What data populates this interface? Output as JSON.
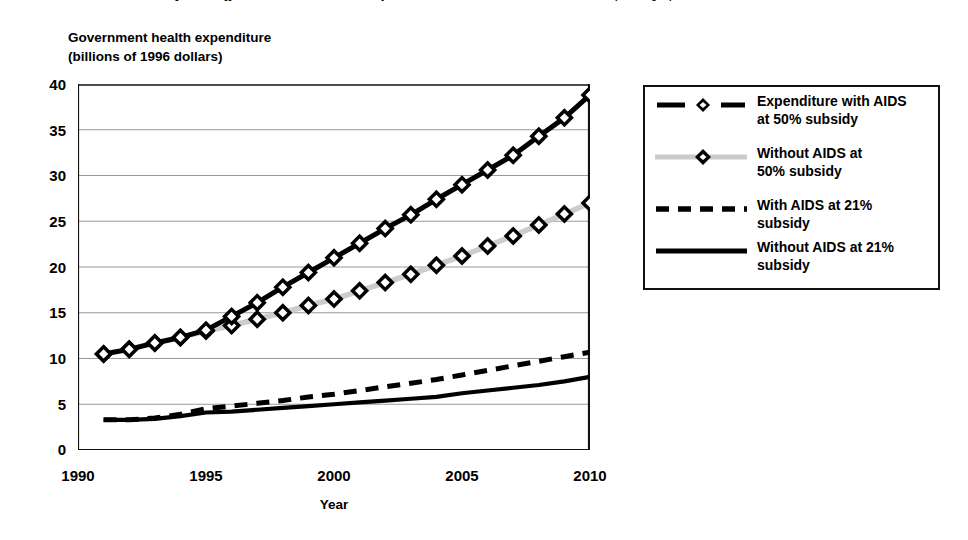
{
  "chart_data": {
    "type": "line",
    "title": "Projected government health expenditure with and without AIDS, Kenya, 1991-2010",
    "xlabel": "Year",
    "ylabel": "Government health expenditure (billions of 1996 dollars)",
    "ylabel_line1": "Government health expenditure",
    "ylabel_line2": "(billions of 1996 dollars)",
    "xlim": [
      1990,
      2010
    ],
    "ylim": [
      0,
      40
    ],
    "xticks": [
      1990,
      1995,
      2000,
      2005,
      2010
    ],
    "yticks": [
      0,
      5,
      10,
      15,
      20,
      25,
      30,
      35,
      40
    ],
    "grid": "horizontal",
    "legend_position": "right",
    "x": [
      1991,
      1992,
      1993,
      1994,
      1995,
      1996,
      1997,
      1998,
      1999,
      2000,
      2001,
      2002,
      2003,
      2004,
      2005,
      2006,
      2007,
      2008,
      2009,
      2010
    ],
    "series": [
      {
        "name": "Expenditure with AIDS at 50% subsidy",
        "style": "solid-black-with-diamond-markers",
        "color": "#000000",
        "marker": "diamond",
        "values": [
          10.5,
          11.0,
          11.7,
          12.3,
          13.1,
          14.6,
          16.1,
          17.8,
          19.4,
          21.0,
          22.6,
          24.2,
          25.7,
          27.4,
          29.0,
          30.6,
          32.2,
          34.3,
          36.3,
          38.8
        ]
      },
      {
        "name": "Without AIDS at 50% subsidy",
        "style": "light-gray-with-diamond-markers",
        "color": "#cccccc",
        "marker": "diamond",
        "values": [
          10.5,
          11.0,
          11.7,
          12.3,
          13.0,
          13.6,
          14.3,
          15.0,
          15.8,
          16.5,
          17.4,
          18.3,
          19.2,
          20.2,
          21.2,
          22.3,
          23.4,
          24.6,
          25.8,
          27.0
        ]
      },
      {
        "name": "With AIDS at 21% subsidy",
        "style": "dashed-black",
        "color": "#000000",
        "marker": "none",
        "values": [
          3.3,
          3.3,
          3.5,
          3.9,
          4.5,
          4.8,
          5.1,
          5.4,
          5.8,
          6.1,
          6.5,
          6.9,
          7.3,
          7.7,
          8.2,
          8.7,
          9.2,
          9.7,
          10.2,
          10.7
        ]
      },
      {
        "name": "Without AIDS at 21% subsidy",
        "style": "solid-black-thick",
        "color": "#000000",
        "marker": "none",
        "values": [
          3.3,
          3.3,
          3.4,
          3.7,
          4.1,
          4.2,
          4.4,
          4.6,
          4.8,
          5.0,
          5.2,
          5.4,
          5.6,
          5.8,
          6.2,
          6.5,
          6.8,
          7.1,
          7.5,
          8.0
        ]
      }
    ]
  },
  "axes": {
    "y_caption_line1": "Government health expenditure",
    "y_caption_line2": "(billions of 1996 dollars)",
    "x_title": "Year",
    "y_tick_labels": [
      "40",
      "35",
      "30",
      "25",
      "20",
      "15",
      "10",
      "5",
      "0"
    ],
    "x_tick_labels": [
      "1990",
      "1995",
      "2000",
      "2005",
      "2010"
    ]
  },
  "legend": {
    "items": [
      {
        "label_line1": "Expenditure with AIDS",
        "label_line2": "at 50% subsidy",
        "key": "dash-diamond-dash"
      },
      {
        "label_line1": "Without AIDS at",
        "label_line2": "50% subsidy",
        "key": "gray-line-diamond"
      },
      {
        "label_line1": "With AIDS at 21%",
        "label_line2": "subsidy",
        "key": "dashed-line"
      },
      {
        "label_line1": "Without AIDS at 21%",
        "label_line2": "subsidy",
        "key": "solid-line"
      }
    ]
  },
  "colors": {
    "axis": "#111111",
    "grid": "#9a9a9a",
    "series_dark": "#000000",
    "series_gray": "#cbcbcb",
    "background": "#ffffff"
  }
}
